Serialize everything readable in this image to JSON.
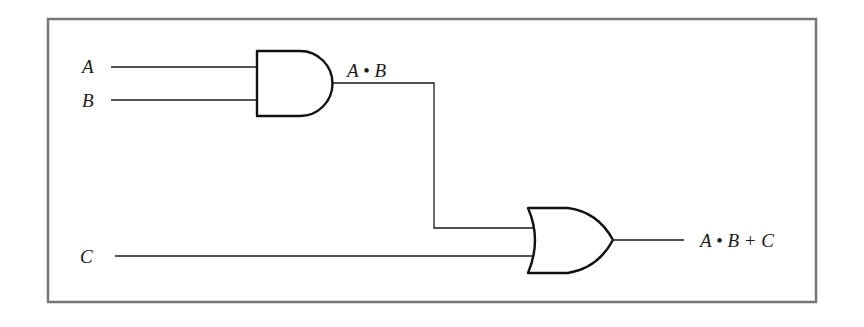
{
  "diagram": {
    "type": "logic-circuit",
    "inputs": [
      {
        "label": "A"
      },
      {
        "label": "B"
      },
      {
        "label": "C"
      }
    ],
    "gates": [
      {
        "type": "AND",
        "inputs": [
          "A",
          "B"
        ],
        "output_label": "A • B"
      },
      {
        "type": "OR",
        "inputs": [
          "A • B",
          "C"
        ],
        "output_label": "A • B + C"
      }
    ],
    "output": "A • B + C"
  },
  "labels": {
    "a": "A",
    "b": "B",
    "c": "C",
    "and_out": "A • B",
    "or_out": "A • B + C"
  }
}
